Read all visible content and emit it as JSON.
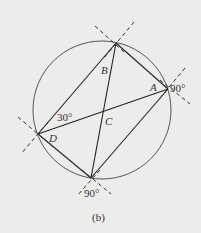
{
  "diagram": {
    "caption": "(b)",
    "background": "#ececea",
    "stroke_color": "#333333",
    "circle": {
      "cx": 102,
      "cy": 110,
      "r": 69
    },
    "vertices": {
      "top": {
        "x": 116,
        "y": 43
      },
      "right": {
        "x": 168,
        "y": 89
      },
      "left": {
        "x": 38,
        "y": 134
      },
      "bottom": {
        "x": 91,
        "y": 178
      }
    },
    "labels": {
      "A": "A",
      "B": "B",
      "C": "C",
      "D": "D",
      "angle_left": "30°",
      "angle_right": "90°",
      "angle_bottom": "90°"
    }
  }
}
